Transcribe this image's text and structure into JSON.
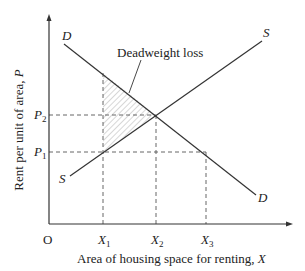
{
  "diagram": {
    "y_axis": {
      "label": "Rent per unit of area, ",
      "var": "P"
    },
    "x_axis": {
      "label": "Area of housing space for renting, ",
      "var": "X"
    },
    "origin": "O",
    "curves": {
      "demand_top": "D",
      "demand_bottom": "D",
      "supply_top": "S",
      "supply_bottom": "S"
    },
    "price_ticks": [
      {
        "base": "P",
        "sub": "2"
      },
      {
        "base": "P",
        "sub": "1"
      }
    ],
    "quantity_ticks": [
      {
        "base": "X",
        "sub": "1"
      },
      {
        "base": "X",
        "sub": "2"
      },
      {
        "base": "X",
        "sub": "3"
      }
    ],
    "annotation": "Deadweight loss",
    "colors": {
      "line": "#333333",
      "hatch": "#9a9a9a",
      "text": "#222222"
    }
  }
}
